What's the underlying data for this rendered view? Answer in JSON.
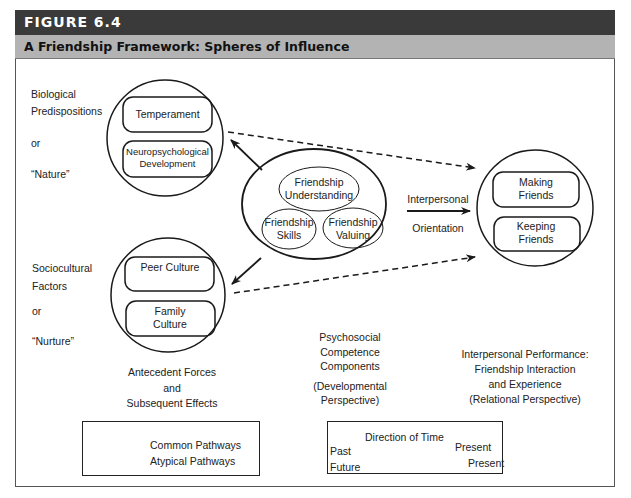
{
  "figure": {
    "number": "FIGURE 6.4",
    "title": "A Friendship Framework: Spheres of Influence"
  },
  "left_labels": {
    "nature": [
      "Biological",
      "Predispositions",
      "or",
      "“Nature”"
    ],
    "nurture": [
      "Sociocultural",
      "Factors",
      "or",
      "“Nurture”"
    ]
  },
  "spheres": {
    "nature": {
      "boxes": [
        "Temperament",
        "Neuropsychological Development"
      ]
    },
    "nurture": {
      "boxes": [
        "Peer Culture",
        "Family Culture"
      ]
    },
    "center": {
      "ovals": [
        "Friendship Understanding",
        "Friendship Skills",
        "Friendship Valuing"
      ]
    },
    "performance": {
      "boxes": [
        "Making Friends",
        "Keeping Friends"
      ]
    }
  },
  "arrow_labels": {
    "top": "Interpersonal",
    "bottom": "Orientation"
  },
  "captions": {
    "antecedent": [
      "Antecedent Forces",
      "and",
      "Subsequent Effects"
    ],
    "psychosocial": [
      "Psychosocial",
      "Competence",
      "Components",
      "(Developmental",
      "Perspective)"
    ],
    "interpersonal": [
      "Interpersonal Performance:",
      "Friendship Interaction",
      "and Experience",
      "(Relational Perspective)"
    ]
  },
  "legend_paths": {
    "common": "Common Pathways",
    "atypical": "Atypical Pathways"
  },
  "legend_time": {
    "title": "Direction of Time",
    "row1_left": "Past",
    "row1_right": "Present",
    "row2_left": "Future",
    "row2_right": "Present"
  },
  "colors": {
    "header_bg": "#3a3a3a",
    "subheader_bg": "#b3b3b3",
    "line": "#1a1a1a"
  }
}
